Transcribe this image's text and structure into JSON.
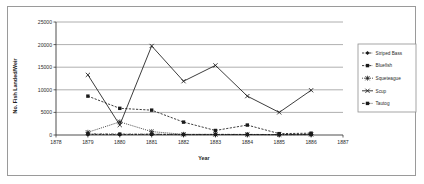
{
  "chart_data": {
    "type": "line",
    "title": "",
    "xlabel": "Year",
    "ylabel": "No. Fish Landed/Weir",
    "xlim": [
      1878,
      1887
    ],
    "ylim": [
      0,
      25000
    ],
    "xticks": [
      "1878",
      "1879",
      "1880",
      "1881",
      "1882",
      "1883",
      "1884",
      "1885",
      "1886",
      "1887"
    ],
    "yticks": [
      "0",
      "5000",
      "10000",
      "15000",
      "20000",
      "25000"
    ],
    "grid": "horizontal",
    "legend_position": "right",
    "x": [
      1879,
      1880,
      1881,
      1882,
      1883,
      1884,
      1885,
      1886
    ],
    "series": [
      {
        "name": "Striped Bass",
        "marker": "diamond",
        "linestyle": "dashed",
        "color": "#1a1a1a",
        "values": [
          120,
          90,
          140,
          80,
          100,
          110,
          70,
          90
        ]
      },
      {
        "name": "Bluefish",
        "marker": "square",
        "linestyle": "dashed",
        "color": "#1a1a1a",
        "values": [
          8600,
          5900,
          5500,
          2850,
          1000,
          2200,
          300,
          400
        ]
      },
      {
        "name": "Squeteague",
        "marker": "star",
        "linestyle": "dotted",
        "color": "#1a1a1a",
        "values": [
          600,
          2900,
          750,
          150,
          120,
          100,
          80,
          120
        ]
      },
      {
        "name": "Scup",
        "marker": "cross",
        "linestyle": "solid",
        "color": "#1a1a1a",
        "values": [
          13300,
          2200,
          19700,
          11900,
          15400,
          8600,
          5000,
          9900
        ]
      },
      {
        "name": "Tautog",
        "marker": "square",
        "linestyle": "dashdot",
        "color": "#1a1a1a",
        "values": [
          250,
          200,
          180,
          120,
          140,
          130,
          100,
          150
        ]
      }
    ]
  },
  "legend": {
    "entries": [
      {
        "label": "Striped Bass"
      },
      {
        "label": "Bluefish"
      },
      {
        "label": "Squeteague"
      },
      {
        "label": "Scup"
      },
      {
        "label": "Tautog"
      }
    ]
  }
}
